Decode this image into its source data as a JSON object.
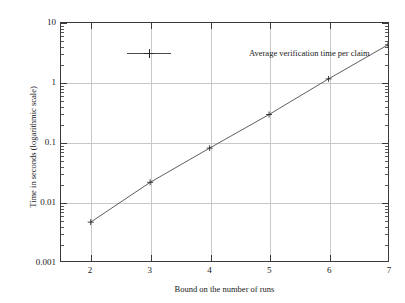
{
  "chart_data": {
    "type": "line",
    "title": "",
    "xlabel": "Bound on the number of runs",
    "ylabel": "Time in seconds (logarithmic scale)",
    "yscale": "log",
    "xlim": [
      1.5,
      7.0
    ],
    "ylim": [
      0.001,
      10
    ],
    "grid": true,
    "legend_position": "top-left-inside",
    "x_ticks": [
      2,
      3,
      4,
      5,
      6,
      7
    ],
    "x_tick_labels": [
      "2",
      "3",
      "4",
      "5",
      "6",
      "7"
    ],
    "y_ticks": [
      0.001,
      0.01,
      0.1,
      1,
      10
    ],
    "y_tick_labels": [
      "0.001",
      "0.01",
      "0.1",
      "1",
      "10"
    ],
    "series": [
      {
        "name": "Average verification time per claim",
        "marker": "plus",
        "color": "#4a4a4a",
        "x": [
          2,
          3,
          4,
          5,
          6,
          7
        ],
        "values": [
          0.0045,
          0.021,
          0.079,
          0.29,
          1.15,
          4.3
        ]
      }
    ]
  },
  "legend": {
    "entries": [
      {
        "label": "Average verification time per claim"
      }
    ]
  },
  "axes": {
    "x_title": "Bound on the number of runs",
    "y_title": "Time in seconds (logarithmic scale)"
  },
  "colors": {
    "line": "#4a4a4a",
    "grid": "#c8c8c8",
    "frame": "#3a3a3a",
    "text": "#1a1a1a",
    "background": "#ffffff"
  }
}
